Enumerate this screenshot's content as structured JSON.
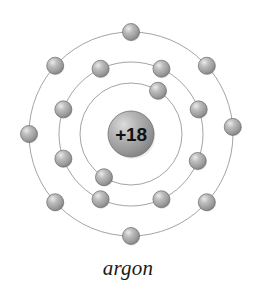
{
  "figure": {
    "kind": "bohr-atomic-model",
    "caption": "argon",
    "background_color": "#ffffff"
  },
  "nucleus": {
    "label": "+18",
    "charge": 18,
    "center_x": 131,
    "center_y": 134,
    "radius": 23,
    "fill_color": "#9b9b9b",
    "highlight_color": "#d8d8d8",
    "edge_color": "#6e6e6e",
    "text_color": "#111111"
  },
  "electron_style": {
    "radius": 8.5,
    "fill_color": "#9d9d9d",
    "highlight_color": "#e2e2e2",
    "edge_color": "#6a6a6a"
  },
  "ring_style": {
    "stroke_color": "#9a9a9a",
    "stroke_width": 0.9
  },
  "shells": [
    {
      "name": "shell-1",
      "index": 1,
      "radius": 51,
      "electron_count": 2,
      "electron_angles_deg": [
        -58,
        122
      ]
    },
    {
      "name": "shell-2",
      "index": 2,
      "radius": 72,
      "electron_count": 8,
      "electron_angles_deg": [
        -115,
        -65,
        -20,
        22,
        65,
        115,
        160,
        200
      ]
    },
    {
      "name": "shell-3",
      "index": 3,
      "radius": 102,
      "electron_count": 8,
      "electron_angles_deg": [
        -90,
        -42,
        -4,
        42,
        90,
        138,
        180,
        222
      ]
    }
  ],
  "chart_data": {
    "type": "scatter",
    "title": "argon",
    "xlabel": "",
    "ylabel": "",
    "annotations": [
      "+18"
    ],
    "series": [
      {
        "name": "shell-1",
        "radius": 51,
        "electrons": 2
      },
      {
        "name": "shell-2",
        "radius": 72,
        "electrons": 8
      },
      {
        "name": "shell-3",
        "radius": 102,
        "electrons": 8
      }
    ],
    "total_electrons": 18
  }
}
